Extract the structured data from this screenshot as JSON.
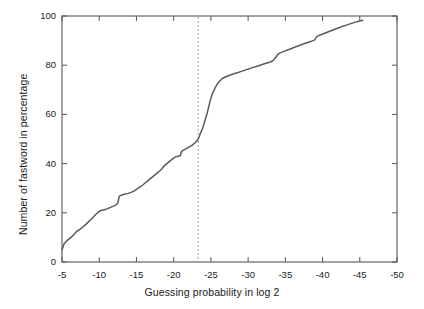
{
  "chart_data": {
    "type": "line",
    "title": "",
    "subtitle": "",
    "xlabel": "Guessing probability in log 2",
    "ylabel": "Number of fastword in percentage",
    "xlim": [
      -5,
      -50
    ],
    "ylim": [
      0,
      100
    ],
    "x_ticks": [
      -5,
      -10,
      -15,
      -20,
      -25,
      -30,
      -35,
      -40,
      -45,
      -50
    ],
    "x_tick_labels": [
      "-5",
      "-10",
      "-15",
      "-20",
      "-25",
      "-30",
      "-35",
      "-40",
      "-45",
      "-50"
    ],
    "y_ticks": [
      0,
      20,
      40,
      60,
      80,
      100
    ],
    "y_tick_labels": [
      "0",
      "20",
      "40",
      "60",
      "80",
      "100"
    ],
    "x_axis_direction": "decreasing",
    "grid": false,
    "legend": false,
    "legend_position": "none",
    "line_color": "#5a5a5a",
    "annotations": [
      {
        "name": "threshold-line",
        "type": "vertical-dashed-line",
        "x": -23.3,
        "style": "dotted",
        "color": "#888888"
      }
    ],
    "series": [
      {
        "name": "cumulative-fastword-percentage",
        "color": "#5a5a5a",
        "x": [
          -5.0,
          -5.3,
          -5.8,
          -6.2,
          -6.6,
          -7.0,
          -7.4,
          -7.8,
          -8.2,
          -8.6,
          -9.0,
          -9.3,
          -9.6,
          -9.9,
          -10.1,
          -10.4,
          -10.8,
          -11.2,
          -11.6,
          -12.0,
          -12.3,
          -12.5,
          -12.6,
          -12.7,
          -13.0,
          -13.4,
          -13.8,
          -14.2,
          -14.6,
          -15.0,
          -15.4,
          -15.8,
          -16.2,
          -16.6,
          -17.0,
          -17.4,
          -17.8,
          -18.2,
          -18.5,
          -18.8,
          -19.2,
          -19.6,
          -20.0,
          -20.3,
          -20.6,
          -20.9,
          -21.0,
          -21.2,
          -21.5,
          -21.8,
          -22.1,
          -22.4,
          -22.7,
          -23.0,
          -23.3,
          -23.6,
          -23.9,
          -24.1,
          -24.3,
          -24.5,
          -24.7,
          -24.9,
          -25.2,
          -25.6,
          -26.0,
          -26.5,
          -27.0,
          -27.6,
          -28.2,
          -28.8,
          -29.4,
          -30.0,
          -30.6,
          -31.2,
          -31.8,
          -32.4,
          -33.0,
          -33.4,
          -33.8,
          -34.0,
          -34.3,
          -34.8,
          -35.4,
          -36.0,
          -36.6,
          -37.2,
          -37.8,
          -38.4,
          -38.9,
          -39.2,
          -39.6,
          -40.2,
          -40.8,
          -41.4,
          -42.0,
          -42.6,
          -43.2,
          -43.8,
          -44.4,
          -45.0,
          -45.4
        ],
        "y": [
          5.0,
          7.5,
          9.0,
          10.0,
          11.2,
          12.5,
          13.3,
          14.2,
          15.3,
          16.5,
          17.6,
          18.6,
          19.5,
          20.3,
          20.8,
          21.0,
          21.3,
          21.8,
          22.3,
          22.8,
          23.3,
          24.0,
          25.5,
          26.8,
          27.2,
          27.5,
          27.8,
          28.2,
          28.7,
          29.5,
          30.3,
          31.2,
          32.2,
          33.2,
          34.2,
          35.2,
          36.2,
          37.2,
          38.2,
          39.3,
          40.3,
          41.3,
          42.2,
          42.8,
          43.0,
          43.2,
          44.5,
          45.3,
          45.8,
          46.2,
          46.8,
          47.3,
          48.0,
          48.8,
          50.0,
          52.3,
          54.5,
          56.5,
          58.5,
          60.5,
          63.0,
          65.5,
          68.5,
          71.0,
          73.0,
          74.5,
          75.3,
          76.0,
          76.6,
          77.2,
          77.8,
          78.4,
          79.0,
          79.6,
          80.2,
          80.8,
          81.3,
          82.0,
          83.5,
          84.5,
          85.0,
          85.6,
          86.3,
          87.0,
          87.7,
          88.4,
          89.0,
          89.6,
          90.2,
          91.5,
          92.2,
          92.9,
          93.6,
          94.3,
          95.0,
          95.7,
          96.3,
          96.9,
          97.5,
          98.0,
          98.3
        ]
      }
    ]
  },
  "axes": {
    "frame_color": "#555555"
  }
}
